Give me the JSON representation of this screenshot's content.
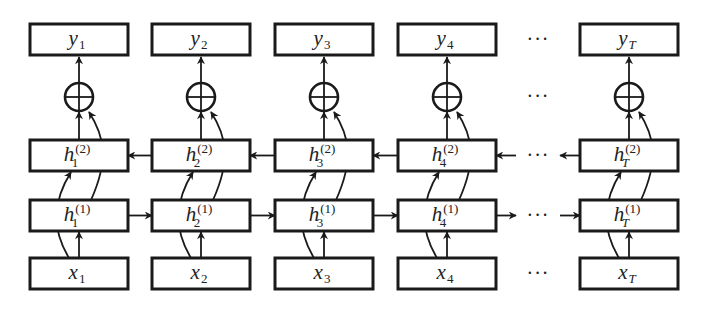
{
  "diagram": {
    "ellipsis": "···",
    "columns": [
      {
        "id": "1",
        "sub": "1",
        "sub_italic": false,
        "y": "y",
        "h2": "h",
        "h2_sup": "(2)",
        "h1": "h",
        "h1_sup": "(1)",
        "x": "x"
      },
      {
        "id": "2",
        "sub": "2",
        "sub_italic": false,
        "y": "y",
        "h2": "h",
        "h2_sup": "(2)",
        "h1": "h",
        "h1_sup": "(1)",
        "x": "x"
      },
      {
        "id": "3",
        "sub": "3",
        "sub_italic": false,
        "y": "y",
        "h2": "h",
        "h2_sup": "(2)",
        "h1": "h",
        "h1_sup": "(1)",
        "x": "x"
      },
      {
        "id": "4",
        "sub": "4",
        "sub_italic": false,
        "y": "y",
        "h2": "h",
        "h2_sup": "(2)",
        "h1": "h",
        "h1_sup": "(1)",
        "x": "x"
      },
      {
        "id": "T",
        "sub": "T",
        "sub_italic": true,
        "y": "y",
        "h2": "h",
        "h2_sup": "(2)",
        "h1": "h",
        "h1_sup": "(1)",
        "x": "x"
      }
    ],
    "layers": {
      "output": "y",
      "combine": "⊕",
      "backward_hidden": "h(2)",
      "forward_hidden": "h(1)",
      "input": "x"
    },
    "forward_direction": "left-to-right",
    "backward_direction": "right-to-left"
  }
}
